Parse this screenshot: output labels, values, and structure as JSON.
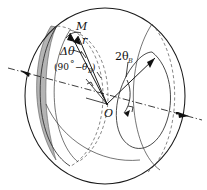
{
  "figure": {
    "name": "sphere-angular-geometry-diagram",
    "background_color": "#ffffff",
    "line_color": "#111111",
    "band_color": "#b4b4b4"
  },
  "labels": {
    "point_m": "M",
    "radius": "r",
    "delta_theta": "Δθ",
    "complement_open": "(90",
    "complement_degree": "°",
    "complement_minus": "−",
    "complement_theta": "θ",
    "complement_sub": "B",
    "complement_close": ")",
    "two_theta": "2θ",
    "two_theta_sub": "B",
    "origin": "O"
  },
  "geometry": {
    "sphere_center_x": 105,
    "sphere_center_y": 96,
    "sphere_radius_x": 80,
    "sphere_radius_y": 88,
    "origin_x": 107,
    "origin_y": 104,
    "point_m_x": 72,
    "point_m_y": 35,
    "axis_angle_deg": 15
  }
}
